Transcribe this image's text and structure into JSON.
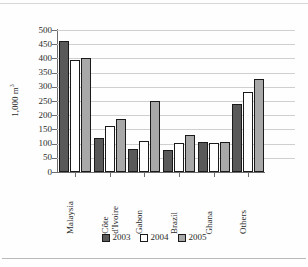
{
  "chart_data": {
    "type": "bar",
    "title": "",
    "subtitle": "",
    "xlabel": "",
    "ylabel": "1,000 m",
    "ylabel_superscript": "3",
    "ylim": [
      0,
      500
    ],
    "ytick_step": 50,
    "yticks": [
      500,
      450,
      400,
      350,
      300,
      250,
      200,
      150,
      100,
      50,
      0
    ],
    "grid": "horizontal",
    "legend_position": "bottom",
    "categories": [
      "Malaysia",
      "Côte\nd'Ivoire",
      "Gabon",
      "Brazil",
      "Ghana",
      "Others"
    ],
    "series": [
      {
        "name": "2003",
        "color": "#595959",
        "values": [
          460,
          120,
          80,
          77,
          107,
          240
        ]
      },
      {
        "name": "2004",
        "color": "#ffffff",
        "values": [
          395,
          162,
          110,
          103,
          102,
          280
        ]
      },
      {
        "name": "2005",
        "color": "#a8a8a8",
        "values": [
          403,
          188,
          250,
          130,
          104,
          327
        ]
      }
    ]
  },
  "legend": {
    "items": [
      {
        "label": "2003"
      },
      {
        "label": "2004"
      },
      {
        "label": "2005"
      }
    ]
  }
}
